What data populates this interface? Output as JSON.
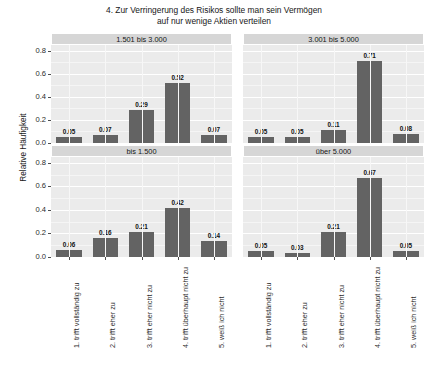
{
  "chart_data": {
    "type": "bar",
    "title": "4. Zur Verringerung des Risikos sollte man sein Vermögen auf nur wenige Aktien verteilen",
    "title_line1": "4. Zur Verringerung des Risikos sollte man sein Vermögen",
    "title_line2": "auf nur wenige Aktien verteilen",
    "xlabel": "",
    "ylabel": "Relative Häufigkeit",
    "ylim": [
      0,
      0.85
    ],
    "yticks": [
      "0.0",
      "0.2",
      "0.4",
      "0.6",
      "0.8"
    ],
    "ytick_values": [
      0.0,
      0.2,
      0.4,
      0.6,
      0.8
    ],
    "grid": true,
    "legend": "none",
    "facet_layout": "2x2",
    "categories": [
      "1. trifft vollständig zu",
      "2. trifft eher zu",
      "3. trifft eher nicht zu",
      "4. trifft überhaupt nicht zu",
      "5. weiß ich nicht"
    ],
    "panels": [
      {
        "facet": "1.501 bis 3.000",
        "row": 0,
        "col": 0,
        "values": [
          0.05,
          0.07,
          0.29,
          0.52,
          0.07
        ],
        "labels": [
          "0.05",
          "0.07",
          "0.29",
          "0.52",
          "0.07"
        ]
      },
      {
        "facet": "3.001 bis 5.000",
        "row": 0,
        "col": 1,
        "values": [
          0.05,
          0.05,
          0.11,
          0.71,
          0.08
        ],
        "labels": [
          "0.05",
          "0.05",
          "0.11",
          "0.71",
          "0.08"
        ]
      },
      {
        "facet": "bis 1.500",
        "row": 1,
        "col": 0,
        "values": [
          0.06,
          0.16,
          0.21,
          0.42,
          0.14
        ],
        "labels": [
          "0.06",
          "0.16",
          "0.21",
          "0.42",
          "0.14"
        ]
      },
      {
        "facet": "über 5.000",
        "row": 1,
        "col": 1,
        "values": [
          0.05,
          0.03,
          0.21,
          0.67,
          0.05
        ],
        "labels": [
          "0.05",
          "0.03",
          "0.21",
          "0.67",
          "0.05"
        ]
      }
    ],
    "colors": {
      "bar": "#636363",
      "panel_background": "#ebebeb",
      "strip_background": "#d6d6d6",
      "gridline": "#ffffff",
      "text": "#1a1a1a",
      "figure_background": "#ffffff"
    }
  }
}
